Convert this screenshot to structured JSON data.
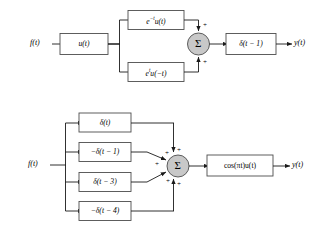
{
  "figure": {
    "background": "#ffffff",
    "box_fill": "#ffffff",
    "box_stroke": "#4d4d4d",
    "line_color": "#1a1a1a",
    "summer_fill": "#c8c8c8",
    "summer_stroke": "#4d4d4d"
  },
  "diagrams": [
    {
      "id": "top-diagram",
      "input_label": "f(t)",
      "output_label": "y(t)",
      "summer_symbol": "Σ",
      "blocks": [
        {
          "id": "block-ut",
          "label": "u(t)"
        },
        {
          "id": "block-exp-neg",
          "label_html": "e<sup>−t</sup>u(t)",
          "label": "e−tu(t)"
        },
        {
          "id": "block-exp-pos",
          "label_html": "e<sup>t</sup>u(−t)",
          "label": "etu(−t)"
        },
        {
          "id": "block-delta-t-minus-1",
          "label": "δ(t − 1)"
        }
      ],
      "summer_signs": [
        "+",
        "+"
      ]
    },
    {
      "id": "bottom-diagram",
      "input_label": "f(t)",
      "output_label": "y(t)",
      "summer_symbol": "Σ",
      "blocks": [
        {
          "id": "block-delta-t",
          "label": "δ(t)"
        },
        {
          "id": "block-neg-delta-t-minus-1",
          "label": "−δ(t − 1)"
        },
        {
          "id": "block-delta-t-minus-3",
          "label": "δ(t − 3)"
        },
        {
          "id": "block-neg-delta-t-minus-4",
          "label": "−δ(t − 4)"
        },
        {
          "id": "block-cos-pi-t",
          "label": "cos(πt)u(t)"
        }
      ],
      "summer_signs": [
        "+",
        "+",
        "+",
        "+",
        "+"
      ]
    }
  ]
}
